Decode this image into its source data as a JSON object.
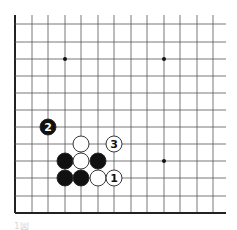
{
  "diagram": {
    "type": "go-board-partial",
    "colors": {
      "background": "#ffffff",
      "grid_line": "#555555",
      "edge_line": "#222222",
      "black_stone": "#111111",
      "white_stone": "#ffffff",
      "stone_outline": "#222222",
      "star_point": "#111111"
    },
    "grid": {
      "cols_x": [
        15,
        32,
        48,
        65,
        81,
        98,
        114,
        131,
        147,
        164,
        180,
        197,
        213
      ],
      "rows_y": [
        24,
        42,
        59,
        76,
        93,
        110,
        127,
        144,
        161,
        178,
        196,
        213
      ],
      "top_y": 15,
      "right_x": 226,
      "left_edge": true,
      "bottom_edge": true
    },
    "star_points": [
      {
        "x": 65,
        "y": 59
      },
      {
        "x": 164,
        "y": 59
      },
      {
        "x": 164,
        "y": 161
      }
    ],
    "stones": [
      {
        "color": "black",
        "x": 48,
        "y": 127,
        "label": "2"
      },
      {
        "color": "white",
        "x": 81,
        "y": 144,
        "label": ""
      },
      {
        "color": "white",
        "x": 114,
        "y": 144,
        "label": "3"
      },
      {
        "color": "black",
        "x": 65,
        "y": 161,
        "label": ""
      },
      {
        "color": "white",
        "x": 81,
        "y": 161,
        "label": ""
      },
      {
        "color": "black",
        "x": 98,
        "y": 161,
        "label": ""
      },
      {
        "color": "black",
        "x": 65,
        "y": 178,
        "label": ""
      },
      {
        "color": "black",
        "x": 81,
        "y": 178,
        "label": ""
      },
      {
        "color": "white",
        "x": 98,
        "y": 178,
        "label": ""
      },
      {
        "color": "white",
        "x": 114,
        "y": 178,
        "label": "1"
      }
    ],
    "stone_radius": 8,
    "caption": "1図"
  }
}
